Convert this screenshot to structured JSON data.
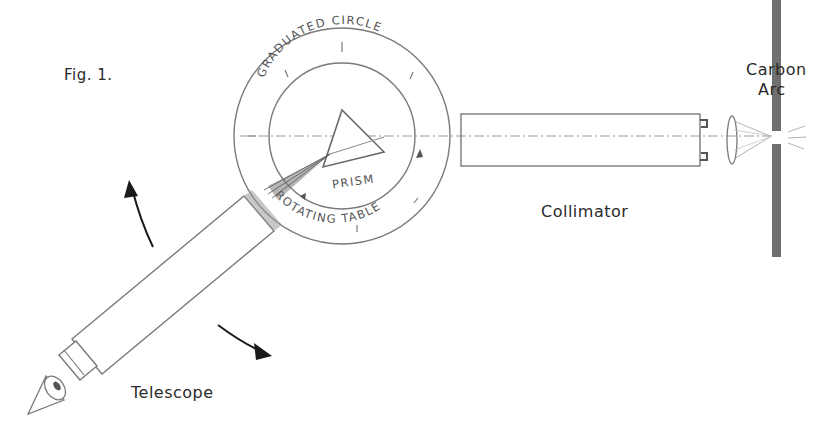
{
  "figure": {
    "caption": "Fig. 1.",
    "labels": {
      "graduated_circle": "GRADUATED CIRCLE",
      "prism": "PRISM",
      "rotating_table": "ROTATING TABLE",
      "carbon_arc_line1": "Carbon",
      "carbon_arc_line2": "Arc",
      "collimator": "Collimator",
      "telescope": "Telescope"
    },
    "components": [
      {
        "name": "graduated-circle",
        "icon": "circle-scale"
      },
      {
        "name": "rotating-table",
        "icon": "inner-circle"
      },
      {
        "name": "prism",
        "icon": "triangle"
      },
      {
        "name": "collimator",
        "icon": "tube-with-lens"
      },
      {
        "name": "carbon-arc",
        "icon": "slit-bar"
      },
      {
        "name": "telescope",
        "icon": "tube-with-eyepiece"
      },
      {
        "name": "eye",
        "icon": "eye-cone"
      },
      {
        "name": "rotation-arrows",
        "icon": "curved-arrows"
      }
    ],
    "colors": {
      "line": "#7a7a7a",
      "dark": "#1a1a1a",
      "slit": "#6f6f6f",
      "text": "#2a2a2a"
    }
  }
}
